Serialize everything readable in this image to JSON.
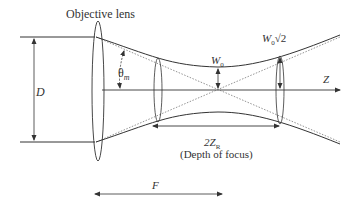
{
  "diagram": {
    "title_label": "Objective lens",
    "aperture_label": "D",
    "angle_label": "θ",
    "angle_subscript": "m",
    "waist_label": "W",
    "waist_subscript": "0",
    "rayleigh_width_label": "W",
    "rayleigh_width_subscript": "0",
    "rayleigh_width_factor": "√2",
    "axis_label": "Z",
    "depth_label": "2Z",
    "depth_subscript": "R",
    "depth_caption": "(Depth of focus)",
    "focal_label": "F",
    "colors": {
      "line": "#333333",
      "dotted": "#666666",
      "background": "#ffffff"
    }
  }
}
